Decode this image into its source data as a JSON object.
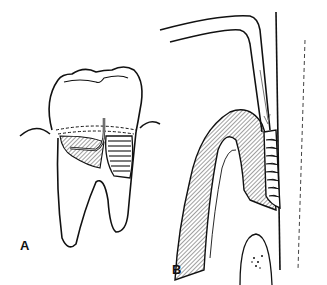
{
  "figure": {
    "panels": [
      {
        "label": "A",
        "subject": "molar-tooth-with-furcation-and-instrument"
      },
      {
        "label": "B",
        "subject": "periodontal-probe-in-pocket-cross-section"
      }
    ]
  },
  "colors": {
    "ink": "#111111",
    "hatch_fill": "#9a9a9a",
    "background": "#ffffff"
  }
}
